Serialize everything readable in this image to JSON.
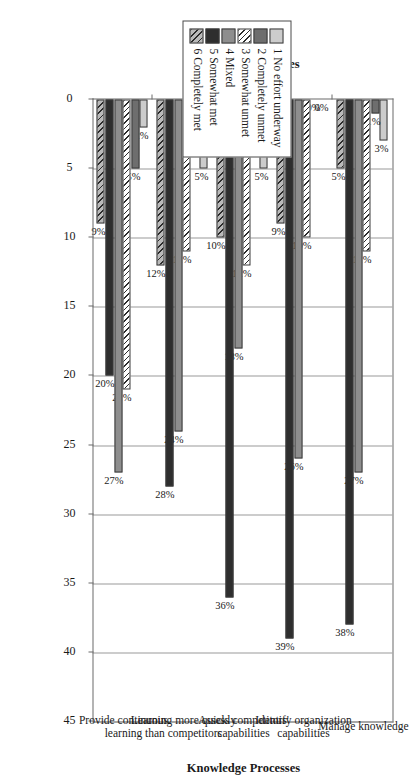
{
  "chart_data": {
    "type": "bar",
    "orientation": "horizontal",
    "title": "",
    "xlabel": "Knowledge Processes",
    "ylabel": "Percent of Responses",
    "ylim": [
      0,
      45
    ],
    "ytick_values": [
      0,
      5,
      10,
      15,
      20,
      25,
      30,
      35,
      40,
      45
    ],
    "ytick_labels": [
      "0",
      "5",
      "10",
      "15",
      "20",
      "25",
      "30",
      "35",
      "40",
      "45"
    ],
    "grid": true,
    "legend_position": "outside-right",
    "value_label_suffix": "%",
    "categories": [
      "Manage knowledge",
      "Identify organization capabilities",
      "Assess competitors' capabilities",
      "Learning more quickly than competitors",
      "Provide continuous learning"
    ],
    "series": [
      {
        "name": "1 No effort underway",
        "key": "1",
        "fill": "f1",
        "values": [
          3,
          0,
          5,
          5,
          2
        ],
        "labels": [
          "3%",
          "0%",
          "5%",
          "5%",
          "2%"
        ]
      },
      {
        "name": "2 Completely unmet",
        "key": "2",
        "fill": "f2",
        "values": [
          1,
          0,
          1,
          2,
          5
        ],
        "labels": [
          "1%",
          "0%",
          "1%",
          "2%",
          "5%"
        ]
      },
      {
        "name": "3 Somewhat unmet",
        "key": "3",
        "fill": "f3",
        "values": [
          11,
          10,
          12,
          11,
          21
        ],
        "labels": [
          "11%",
          "10%",
          "12%",
          "11%",
          "21%"
        ]
      },
      {
        "name": "4 Mixed",
        "key": "4",
        "fill": "f4",
        "values": [
          27,
          26,
          18,
          24,
          27
        ],
        "labels": [
          "27%",
          "26%",
          "18%",
          "24%",
          "27%"
        ]
      },
      {
        "name": "5 Somewhat met",
        "key": "5",
        "fill": "f5",
        "values": [
          38,
          39,
          36,
          28,
          20
        ],
        "labels": [
          "38%",
          "39%",
          "36%",
          "28%",
          "20%"
        ]
      },
      {
        "name": "6 Completely met",
        "key": "6",
        "fill": "f6",
        "values": [
          5,
          9,
          10,
          12,
          9
        ],
        "labels": [
          "5%",
          "9%",
          "10%",
          "12%",
          "9%"
        ]
      }
    ]
  },
  "legend": {
    "items": [
      {
        "index": "1",
        "label": "1 No effort underway",
        "swatch": "f1"
      },
      {
        "index": "2",
        "label": "2 Completely unmet",
        "swatch": "f2"
      },
      {
        "index": "3",
        "label": "3 Somewhat unmet",
        "swatch": "f3"
      },
      {
        "index": "4",
        "label": "4 Mixed",
        "swatch": "f4"
      },
      {
        "index": "5",
        "label": "5 Somewhat met",
        "swatch": "f5"
      },
      {
        "index": "6",
        "label": "6 Completely met",
        "swatch": "f6"
      }
    ]
  },
  "colors": {
    "axis": "#6a6a6a",
    "grid": "#9a9a9a",
    "text": "#1a1a1a"
  }
}
